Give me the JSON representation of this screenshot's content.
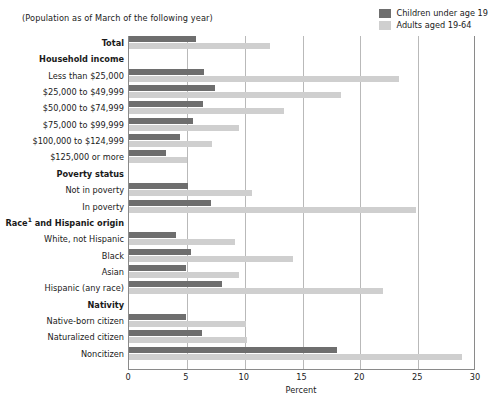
{
  "subtitle": "(Population as of March of the following year)",
  "legend": {
    "items": [
      {
        "label": "Children under age 19",
        "color": "#6e6e6e",
        "key": "children"
      },
      {
        "label": "Adults aged 19-64",
        "color": "#cfcfcf",
        "key": "adults"
      }
    ]
  },
  "axis": {
    "xlabel": "Percent",
    "ticks": [
      "0",
      "5",
      "10",
      "15",
      "20",
      "25",
      "30"
    ]
  },
  "chart_data": {
    "type": "bar",
    "orientation": "horizontal",
    "title": "",
    "subtitle": "(Population as of March of the following year)",
    "xlabel": "Percent",
    "ylabel": "",
    "xlim": [
      0,
      30
    ],
    "xticks": [
      0,
      5,
      10,
      15,
      20,
      25,
      30
    ],
    "grid": "vertical",
    "legend_position": "top-right",
    "series": [
      {
        "name": "Children under age 19",
        "color": "#6e6e6e"
      },
      {
        "name": "Adults aged 19-64",
        "color": "#cfcfcf"
      }
    ],
    "rows": [
      {
        "label": "Total",
        "type": "group",
        "bold": true,
        "children": 5.8,
        "adults": 12.2
      },
      {
        "label": "Household income",
        "type": "header",
        "bold": true
      },
      {
        "label": "Less than $25,000",
        "type": "data",
        "children": 6.5,
        "adults": 23.3
      },
      {
        "label": "$25,000 to $49,999",
        "type": "data",
        "children": 7.4,
        "adults": 18.3
      },
      {
        "label": "$50,000 to $74,999",
        "type": "data",
        "children": 6.4,
        "adults": 13.4
      },
      {
        "label": "$75,000 to $99,999",
        "type": "data",
        "children": 5.5,
        "adults": 9.5
      },
      {
        "label": "$100,000 to $124,999",
        "type": "data",
        "children": 4.4,
        "adults": 7.2
      },
      {
        "label": "$125,000 or more",
        "type": "data",
        "children": 3.2,
        "adults": 5.0
      },
      {
        "label": "Poverty status",
        "type": "header",
        "bold": true
      },
      {
        "label": "Not in poverty",
        "type": "data",
        "children": 5.1,
        "adults": 10.6
      },
      {
        "label": "In poverty",
        "type": "data",
        "children": 7.1,
        "adults": 24.8
      },
      {
        "label": "Race and Hispanic origin",
        "type": "header",
        "bold": true,
        "footnote": "1",
        "label_prefix": "Race",
        "label_suffix": " and Hispanic origin"
      },
      {
        "label": "White, not Hispanic",
        "type": "data",
        "children": 4.1,
        "adults": 9.2
      },
      {
        "label": "Black",
        "type": "data",
        "children": 5.4,
        "adults": 14.2
      },
      {
        "label": "Asian",
        "type": "data",
        "children": 4.9,
        "adults": 9.5
      },
      {
        "label": "Hispanic (any race)",
        "type": "data",
        "children": 8.0,
        "adults": 22.0
      },
      {
        "label": "Nativity",
        "type": "header",
        "bold": true
      },
      {
        "label": "Native-born citizen",
        "type": "data",
        "children": 4.9,
        "adults": 10.1
      },
      {
        "label": "Naturalized citizen",
        "type": "data",
        "children": 6.3,
        "adults": 10.2
      },
      {
        "label": "Noncitizen",
        "type": "data",
        "children": 18.0,
        "adults": 28.8
      }
    ]
  }
}
